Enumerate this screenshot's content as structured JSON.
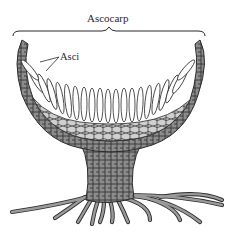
{
  "diagram": {
    "labels": {
      "ascocarp": "Ascocarp",
      "asci": "Asci"
    },
    "parts": [
      "brace",
      "cup-wall",
      "hymenium-asci",
      "subhymenial-tissue",
      "stalk",
      "hyphae-roots"
    ],
    "colors": {
      "line": "#2a2a2a",
      "tissue_fill": "#8c8c8c",
      "light_fill": "#cfcfcf",
      "background": "#ffffff"
    }
  }
}
